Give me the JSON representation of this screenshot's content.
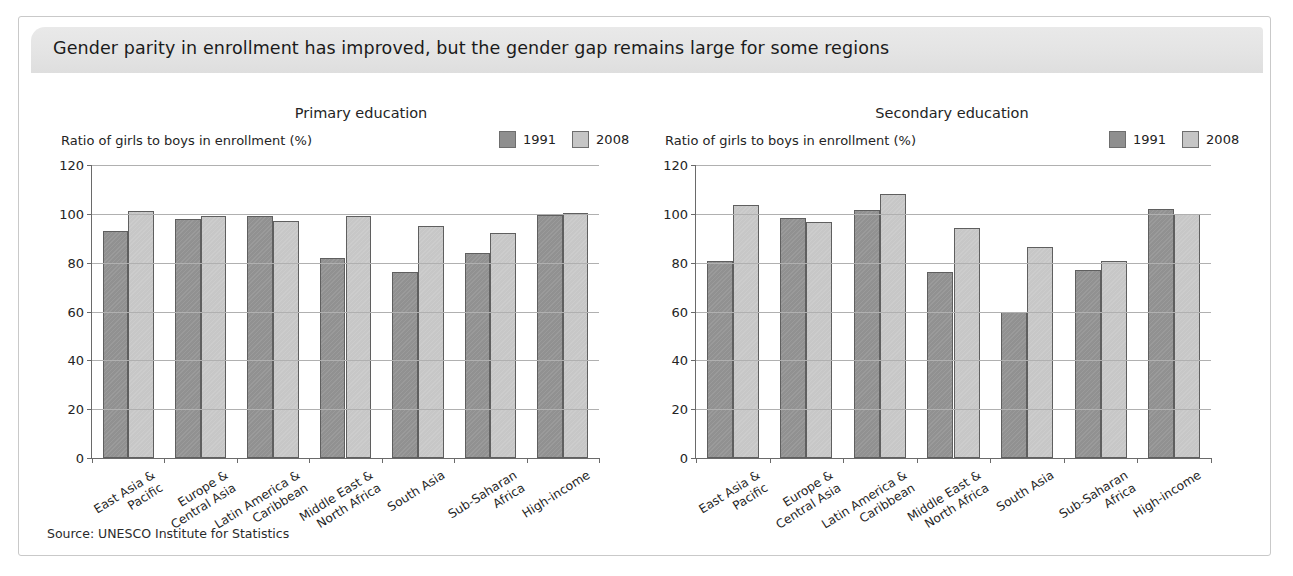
{
  "header": {
    "title": "Gender parity in enrollment has improved, but the gender gap remains large for some regions"
  },
  "source": "Source: UNESCO Institute for Statistics",
  "legend": {
    "series1_label": "1991",
    "series2_label": "2008",
    "series1_color": "#919191",
    "series2_color": "#c7c7c7"
  },
  "axis": {
    "ylabel": "Ratio of girls to boys in enrollment (%)",
    "yticks": [
      0,
      20,
      40,
      60,
      80,
      100,
      120
    ]
  },
  "categories": [
    "East Asia &\nPacific",
    "Europe &\nCentral Asia",
    "Latin America &\nCaribbean",
    "Middle East &\nNorth Africa",
    "South Asia",
    "Sub-Saharan\nAfrica",
    "High-income"
  ],
  "chart_data": [
    {
      "type": "bar",
      "title": "Primary education",
      "xlabel": "",
      "ylabel": "Ratio of girls to boys in enrollment (%)",
      "ylim": [
        0,
        120
      ],
      "yticks": [
        0,
        20,
        40,
        60,
        80,
        100,
        120
      ],
      "grid": true,
      "legend_position": "top-right",
      "categories": [
        "East Asia & Pacific",
        "Europe & Central Asia",
        "Latin America & Caribbean",
        "Middle East & North Africa",
        "South Asia",
        "Sub-Saharan Africa",
        "High-income"
      ],
      "series": [
        {
          "name": "1991",
          "color": "#919191",
          "values": [
            93,
            98,
            99,
            82,
            76,
            84,
            99.5
          ]
        },
        {
          "name": "2008",
          "color": "#c7c7c7",
          "values": [
            101,
            99,
            97,
            99,
            95,
            92,
            100.5
          ]
        }
      ]
    },
    {
      "type": "bar",
      "title": "Secondary education",
      "xlabel": "",
      "ylabel": "Ratio of girls to boys in enrollment (%)",
      "ylim": [
        0,
        120
      ],
      "yticks": [
        0,
        20,
        40,
        60,
        80,
        100,
        120
      ],
      "grid": true,
      "legend_position": "top-right",
      "categories": [
        "East Asia & Pacific",
        "Europe & Central Asia",
        "Latin America & Caribbean",
        "Middle East & North Africa",
        "South Asia",
        "Sub-Saharan Africa",
        "High-income"
      ],
      "series": [
        {
          "name": "1991",
          "color": "#919191",
          "values": [
            80.5,
            98.5,
            101.5,
            76,
            60,
            77,
            102
          ]
        },
        {
          "name": "2008",
          "color": "#c7c7c7",
          "values": [
            103.5,
            96.5,
            108,
            94,
            86.5,
            80.5,
            100
          ]
        }
      ]
    }
  ]
}
